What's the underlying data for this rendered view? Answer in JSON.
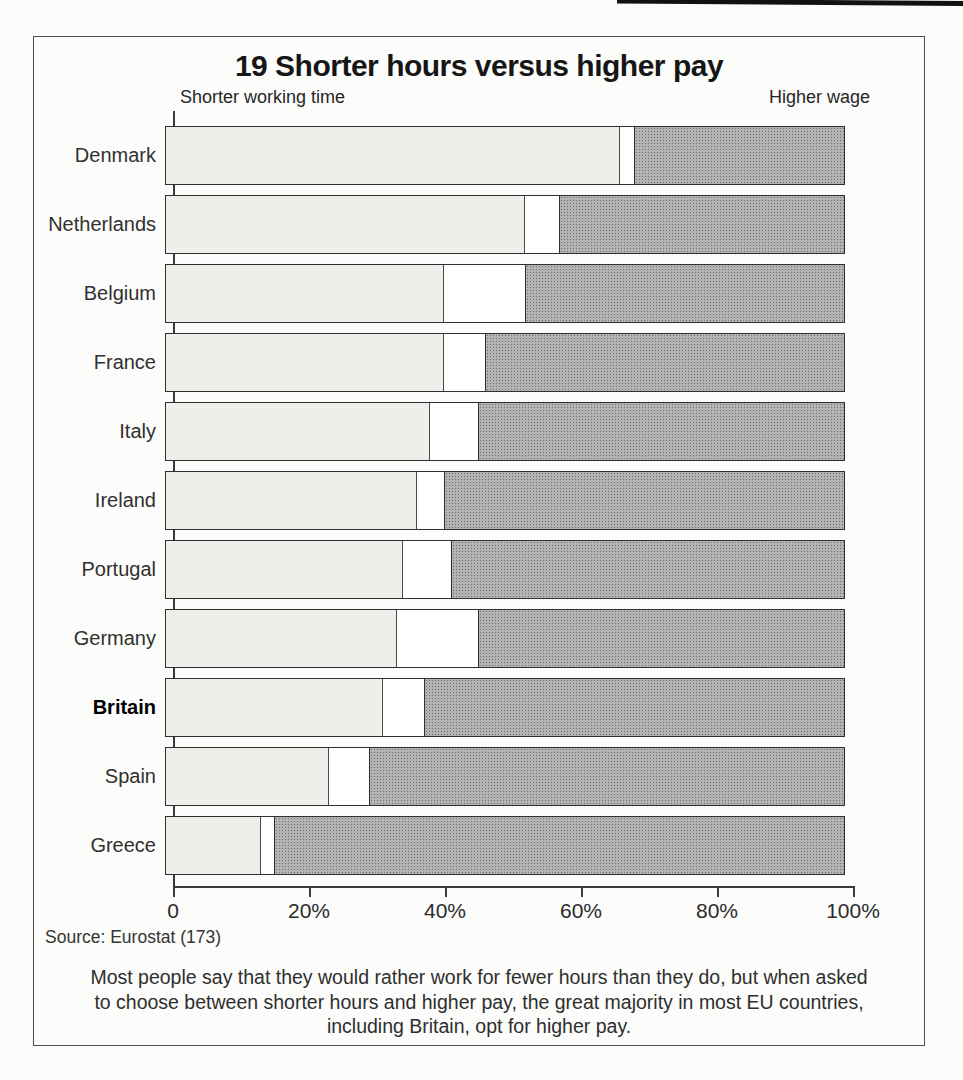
{
  "figure": {
    "title": "19 Shorter hours versus higher pay",
    "left_axis_label": "Shorter working time",
    "right_axis_label": "Higher wage",
    "source": "Source: Eurostat (173)",
    "caption_line1": "Most people say that they would rather work for fewer hours than they do, but when asked",
    "caption_line2": "to choose between shorter hours and higher pay, the great majority in most EU countries,",
    "caption_line3": "including Britain, opt for higher pay."
  },
  "axis": {
    "ticks": [
      "0",
      "20%",
      "40%",
      "60%",
      "80%",
      "100%"
    ],
    "tick_positions_pct": [
      0,
      20,
      40,
      60,
      80,
      100
    ]
  },
  "colors": {
    "light_fill": "#eeeeeb",
    "dark_base": "#b3b3b1",
    "dark_dot": "#6e6e6c",
    "border": "#2e2e2e"
  },
  "countries": [
    {
      "name": "Denmark",
      "shorter": 67,
      "gap": 2,
      "higher": 31,
      "bold": false
    },
    {
      "name": "Netherlands",
      "shorter": 53,
      "gap": 5,
      "higher": 42,
      "bold": false
    },
    {
      "name": "Belgium",
      "shorter": 41,
      "gap": 12,
      "higher": 47,
      "bold": false
    },
    {
      "name": "France",
      "shorter": 41,
      "gap": 6,
      "higher": 53,
      "bold": false
    },
    {
      "name": "Italy",
      "shorter": 39,
      "gap": 7,
      "higher": 54,
      "bold": false
    },
    {
      "name": "Ireland",
      "shorter": 37,
      "gap": 4,
      "higher": 59,
      "bold": false
    },
    {
      "name": "Portugal",
      "shorter": 35,
      "gap": 7,
      "higher": 58,
      "bold": false
    },
    {
      "name": "Germany",
      "shorter": 34,
      "gap": 12,
      "higher": 54,
      "bold": false
    },
    {
      "name": "Britain",
      "shorter": 32,
      "gap": 6,
      "higher": 62,
      "bold": true
    },
    {
      "name": "Spain",
      "shorter": 24,
      "gap": 6,
      "higher": 70,
      "bold": false
    },
    {
      "name": "Greece",
      "shorter": 14,
      "gap": 2,
      "higher": 84,
      "bold": false
    }
  ],
  "chart_data": {
    "type": "bar",
    "orientation": "horizontal-stacked",
    "title": "19 Shorter hours versus higher pay",
    "categories": [
      "Denmark",
      "Netherlands",
      "Belgium",
      "France",
      "Italy",
      "Ireland",
      "Portugal",
      "Germany",
      "Britain",
      "Spain",
      "Greece"
    ],
    "series": [
      {
        "name": "Shorter working time",
        "values": [
          67,
          53,
          41,
          41,
          39,
          37,
          35,
          34,
          32,
          24,
          14
        ]
      },
      {
        "name": "No preference (unlabelled white gap)",
        "values": [
          2,
          5,
          12,
          6,
          7,
          4,
          7,
          12,
          6,
          6,
          2
        ]
      },
      {
        "name": "Higher wage",
        "values": [
          31,
          42,
          47,
          53,
          54,
          59,
          58,
          54,
          62,
          70,
          84
        ]
      }
    ],
    "xlabel": "",
    "ylabel": "",
    "xlim": [
      0,
      100
    ],
    "x_ticks": [
      "0",
      "20%",
      "40%",
      "60%",
      "80%",
      "100%"
    ],
    "grid": false,
    "legend_position": "above-plot-edges",
    "highlighted_category": "Britain",
    "source": "Source: Eurostat (173)"
  }
}
